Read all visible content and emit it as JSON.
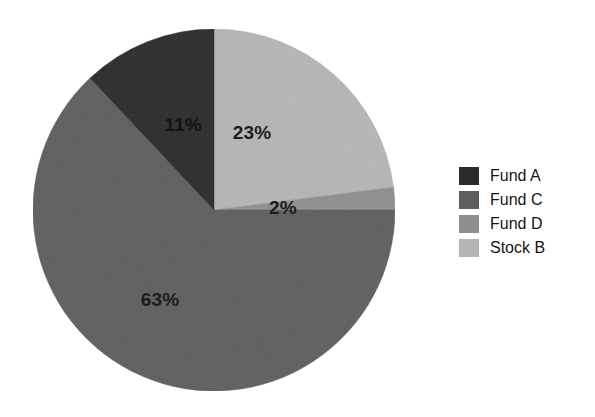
{
  "chart_data": {
    "type": "pie",
    "title": "",
    "subtitle": "",
    "xlabel": "",
    "ylabel": "",
    "grid": false,
    "legend_position": "right",
    "start_angle_deg": 0,
    "direction": "clockwise",
    "center": {
      "x": 214,
      "y": 210
    },
    "radius": 181,
    "categories": [
      "Stock B",
      "Fund D",
      "Fund C",
      "Fund A"
    ],
    "values": [
      23,
      2,
      63,
      11
    ],
    "slices": [
      {
        "name": "Stock B",
        "value": 23,
        "label": "23%",
        "color": "#b5b5b5",
        "start_deg": 0,
        "end_deg": 82.8,
        "label_x": 252,
        "label_y": 139
      },
      {
        "name": "Fund D",
        "value": 2,
        "label": "2%",
        "color": "#8e8e8e",
        "start_deg": 82.8,
        "end_deg": 90.0,
        "label_x": 283,
        "label_y": 214
      },
      {
        "name": "Fund C",
        "value": 63,
        "label": "63%",
        "color": "#5e5e5e",
        "start_deg": 90.0,
        "end_deg": 316.8,
        "label_x": 160,
        "label_y": 306
      },
      {
        "name": "Fund A",
        "value": 11,
        "label": "11%",
        "color": "#2b2b2b",
        "start_deg": 316.8,
        "end_deg": 360.0,
        "label_x": 183,
        "label_y": 131
      }
    ]
  },
  "legend": {
    "items": [
      {
        "label": "Fund A",
        "color": "#2b2b2b"
      },
      {
        "label": "Fund C",
        "color": "#5e5e5e"
      },
      {
        "label": "Fund D",
        "color": "#8e8e8e"
      },
      {
        "label": "Stock B",
        "color": "#b5b5b5"
      }
    ]
  }
}
